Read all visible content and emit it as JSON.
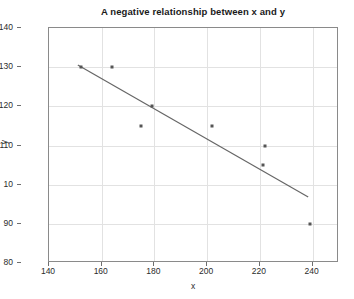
{
  "chart_data": {
    "type": "scatter",
    "title": "A negative relationship between x and y",
    "xlabel": "x",
    "ylabel": "y",
    "xlim": [
      140,
      250
    ],
    "ylim": [
      80,
      140
    ],
    "grid": true,
    "legend": null,
    "xticks": [
      "140",
      "160",
      "180",
      "200",
      "220",
      "240"
    ],
    "xtick_values": [
      140,
      160,
      180,
      200,
      220,
      240
    ],
    "yticks": [
      "80",
      "90",
      "10",
      "110",
      "120",
      "130",
      "140"
    ],
    "ytick_values": [
      80,
      90,
      100,
      110,
      120,
      130,
      140
    ],
    "x": [
      152,
      164,
      175,
      179,
      202,
      222,
      221,
      239
    ],
    "y": [
      130,
      130,
      115,
      120,
      115,
      110,
      105,
      90
    ],
    "points": [
      {
        "x": 152,
        "y": 130
      },
      {
        "x": 164,
        "y": 130
      },
      {
        "x": 175,
        "y": 115
      },
      {
        "x": 179,
        "y": 120
      },
      {
        "x": 202,
        "y": 115
      },
      {
        "x": 222,
        "y": 110
      },
      {
        "x": 221,
        "y": 105
      },
      {
        "x": 239,
        "y": 90
      }
    ],
    "trendline": {
      "type": "line",
      "x": [
        151,
        239
      ],
      "y": [
        130.5,
        96.5
      ]
    },
    "colors": {
      "marker": "#555555",
      "trendline": "#666666",
      "grid": "#e2e2e2",
      "axis": "#8a8a8a",
      "text": "#2b2b2b",
      "background": "#ffffff"
    }
  }
}
